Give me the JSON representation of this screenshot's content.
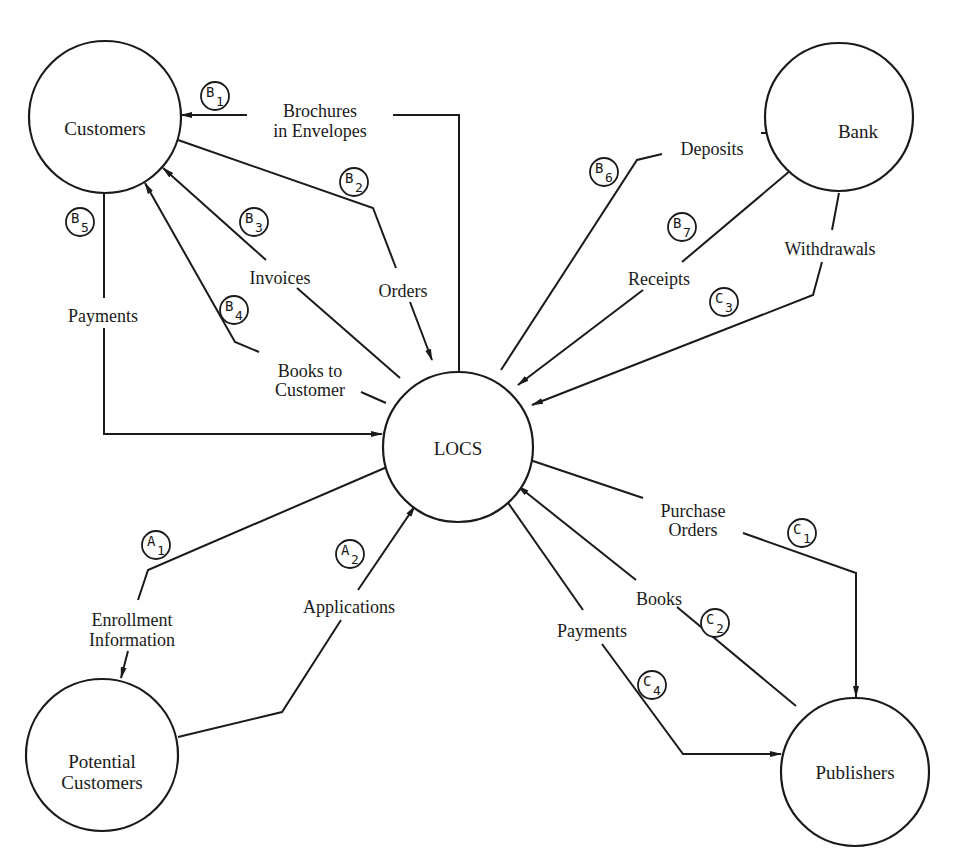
{
  "diagram": {
    "type": "context-diagram",
    "colors": {
      "stroke": "#1a1a1a",
      "background": "#ffffff"
    },
    "nodes": {
      "customers": {
        "label": "Customers"
      },
      "bank": {
        "label": "Bank"
      },
      "locs": {
        "label": "LOCS"
      },
      "potential_customers": {
        "label_line1": "Potential",
        "label_line2": "Customers"
      },
      "publishers": {
        "label": "Publishers"
      }
    },
    "flows": {
      "b1": {
        "tag_letter": "B",
        "tag_number": "1",
        "label_line1": "Brochures",
        "label_line2": "in Envelopes",
        "from": "LOCS",
        "to": "Customers"
      },
      "b2": {
        "tag_letter": "B",
        "tag_number": "2",
        "label": "Orders",
        "from": "Customers",
        "to": "LOCS"
      },
      "b3": {
        "tag_letter": "B",
        "tag_number": "3",
        "label": "Invoices",
        "from": "LOCS",
        "to": "Customers"
      },
      "b4": {
        "tag_letter": "B",
        "tag_number": "4",
        "label_line1": "Books to",
        "label_line2": "Customer",
        "from": "LOCS",
        "to": "Customers"
      },
      "b5": {
        "tag_letter": "B",
        "tag_number": "5",
        "label": "Payments",
        "from": "Customers",
        "to": "LOCS"
      },
      "b6": {
        "tag_letter": "B",
        "tag_number": "6",
        "label": "Deposits",
        "from": "LOCS",
        "to": "Bank"
      },
      "b7": {
        "tag_letter": "B",
        "tag_number": "7",
        "label": "Receipts",
        "from": "Bank",
        "to": "LOCS"
      },
      "c3": {
        "tag_letter": "C",
        "tag_number": "3",
        "label": "Withdrawals",
        "from": "Bank",
        "to": "LOCS"
      },
      "a1": {
        "tag_letter": "A",
        "tag_number": "1",
        "label_line1": "Enrollment",
        "label_line2": "Information",
        "from": "LOCS",
        "to": "Potential Customers"
      },
      "a2": {
        "tag_letter": "A",
        "tag_number": "2",
        "label": "Applications",
        "from": "Potential Customers",
        "to": "LOCS"
      },
      "c1": {
        "tag_letter": "C",
        "tag_number": "1",
        "label_line1": "Purchase",
        "label_line2": "Orders",
        "from": "LOCS",
        "to": "Publishers"
      },
      "c2": {
        "tag_letter": "C",
        "tag_number": "2",
        "label": "Books",
        "from": "Publishers",
        "to": "LOCS"
      },
      "c4": {
        "tag_letter": "C",
        "tag_number": "4",
        "label": "Payments",
        "from": "LOCS",
        "to": "Publishers"
      }
    }
  }
}
